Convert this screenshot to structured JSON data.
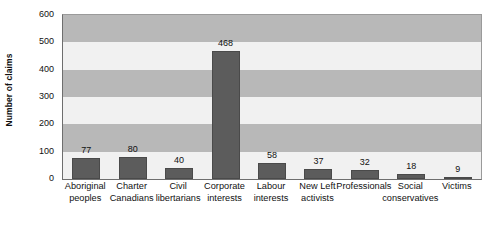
{
  "chart_data": {
    "type": "bar",
    "title": "",
    "xlabel": "",
    "ylabel": "Number of claims",
    "ylim": [
      0,
      600
    ],
    "ytick_labels": [
      "600",
      "500",
      "400",
      "300",
      "200",
      "100",
      "0"
    ],
    "yticks": [
      600,
      500,
      400,
      300,
      200,
      100,
      0
    ],
    "grid": false,
    "banded_background": true,
    "legend": "none",
    "categories": [
      "Aboriginal peoples",
      "Charter Canadians",
      "Civil libertarians",
      "Corporate interests",
      "Labour interests",
      "New Left activists",
      "Professionals",
      "Social conservatives",
      "Victims"
    ],
    "category_lines": [
      [
        "Aboriginal",
        "peoples"
      ],
      [
        "Charter",
        "Canadians"
      ],
      [
        "Civil",
        "libertarians"
      ],
      [
        "Corporate",
        "interests"
      ],
      [
        "Labour",
        "interests"
      ],
      [
        "New Left",
        "activists"
      ],
      [
        "Professionals",
        ""
      ],
      [
        "Social",
        "conservatives"
      ],
      [
        "Victims",
        ""
      ]
    ],
    "values": [
      77,
      80,
      40,
      468,
      58,
      37,
      32,
      18,
      9
    ],
    "value_labels": [
      "77",
      "80",
      "40",
      "468",
      "58",
      "37",
      "32",
      "18",
      "9"
    ],
    "colors": {
      "bar": "#5c5c5c",
      "bar_border": "#4a4a4a",
      "band_dark": "#b8b8b8",
      "band_light": "#f1f1f1",
      "axis": "#6e6e6e",
      "text": "#111111",
      "background": "#ffffff"
    }
  }
}
